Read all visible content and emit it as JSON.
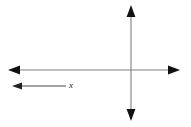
{
  "figure": {
    "title": "",
    "background_color": "#ffffff",
    "width": 191,
    "height": 127,
    "axis_color": "#808080",
    "arrowhead_color": "#111111",
    "vector_color": "#4a4a4a",
    "label_color": "#1a1a1a"
  },
  "axes": {
    "horizontal": {
      "name": "horizontal-axis",
      "y": 70,
      "x_start": 8,
      "x_end": 180,
      "arrow_start": true,
      "arrow_end": true
    },
    "vertical": {
      "name": "vertical-axis",
      "x": 131,
      "y_start": 5,
      "y_end": 121,
      "arrow_start": true,
      "arrow_end": true
    },
    "origin": {
      "x": 131,
      "y": 70
    }
  },
  "vectors": [
    {
      "name": "x-vector",
      "label": "x",
      "y": 86,
      "tail_x": 66,
      "head_x": 12,
      "direction": "left",
      "label_x": 69,
      "label_y": 81
    }
  ],
  "chart_data": {
    "type": "diagram",
    "title": "",
    "xlabel": "x",
    "ylabel": "",
    "grid": false,
    "legend": null,
    "annotations": [
      {
        "text": "x",
        "x": 69,
        "y": 86,
        "style": "italic"
      }
    ],
    "elements": [
      {
        "kind": "double-arrow",
        "orientation": "horizontal",
        "from": [
          8,
          70
        ],
        "to": [
          180,
          70
        ]
      },
      {
        "kind": "double-arrow",
        "orientation": "vertical",
        "from": [
          131,
          5
        ],
        "to": [
          131,
          121
        ]
      },
      {
        "kind": "single-arrow",
        "orientation": "horizontal",
        "from": [
          66,
          86
        ],
        "to": [
          12,
          86
        ]
      }
    ]
  }
}
